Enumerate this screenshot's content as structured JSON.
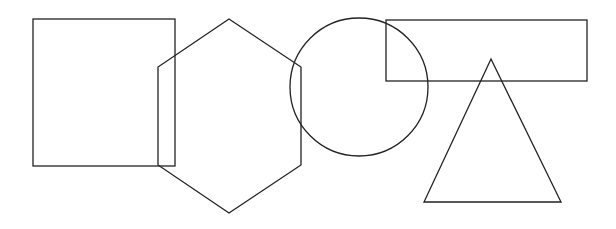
{
  "canvas": {
    "width": 616,
    "height": 229,
    "background": "#ffffff",
    "stroke": "#222222"
  },
  "shapes": [
    {
      "type": "square",
      "x": 33,
      "y": 19,
      "width": 142,
      "height": 147
    },
    {
      "type": "hexagon",
      "points": "229,19 301,67 301,165 229,213 158,165 158,67"
    },
    {
      "type": "circle",
      "cx": 359,
      "cy": 87,
      "r": 69
    },
    {
      "type": "rectangle",
      "x": 386,
      "y": 20,
      "width": 201,
      "height": 61
    },
    {
      "type": "triangle",
      "points": "491,59 561,202 424,202"
    }
  ]
}
